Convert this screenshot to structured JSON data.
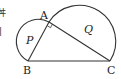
{
  "diagram": {
    "points": {
      "A": {
        "label": "A",
        "x": 49,
        "y": 22
      },
      "B": {
        "label": "B",
        "x": 28,
        "y": 61
      },
      "C": {
        "label": "C",
        "x": 110,
        "y": 61
      }
    },
    "regions": {
      "P": {
        "label": "P"
      },
      "Q": {
        "label": "Q"
      }
    },
    "segments": [
      "AB",
      "AC",
      "BC"
    ],
    "semicircles": [
      "on AB (region P)",
      "on AC (region Q)"
    ],
    "right_angle_at": "A",
    "stroke_color": "#333333"
  },
  "left_fragments": [
    "丼",
    "|"
  ]
}
